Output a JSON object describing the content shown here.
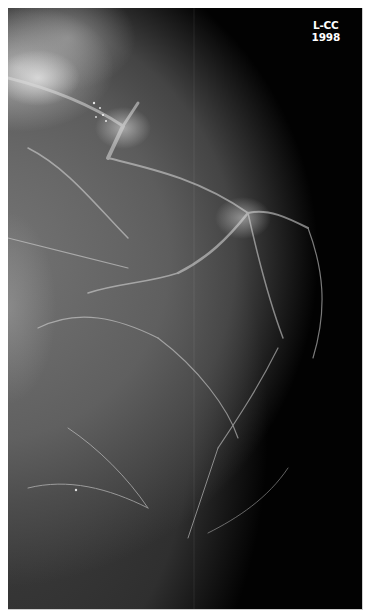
{
  "image": {
    "type": "mammogram",
    "view_label": "L-CC",
    "year_label": "1998",
    "background_color": "#020202",
    "border_color": "#ffffff"
  }
}
